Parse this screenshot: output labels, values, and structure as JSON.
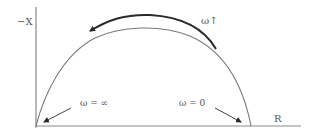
{
  "diagram": {
    "type": "nyquist-plot-semicircle",
    "axes": {
      "y_label": "−X",
      "x_label": "R"
    },
    "annotations": {
      "direction_label": "ω↑",
      "high_freq_label": "ω = ∞",
      "low_freq_label": "ω = 0"
    },
    "colors": {
      "axis": "#8a8a8a",
      "curve": "#7a7a7a",
      "arrow": "#2a2a2a",
      "text": "#555555"
    }
  }
}
